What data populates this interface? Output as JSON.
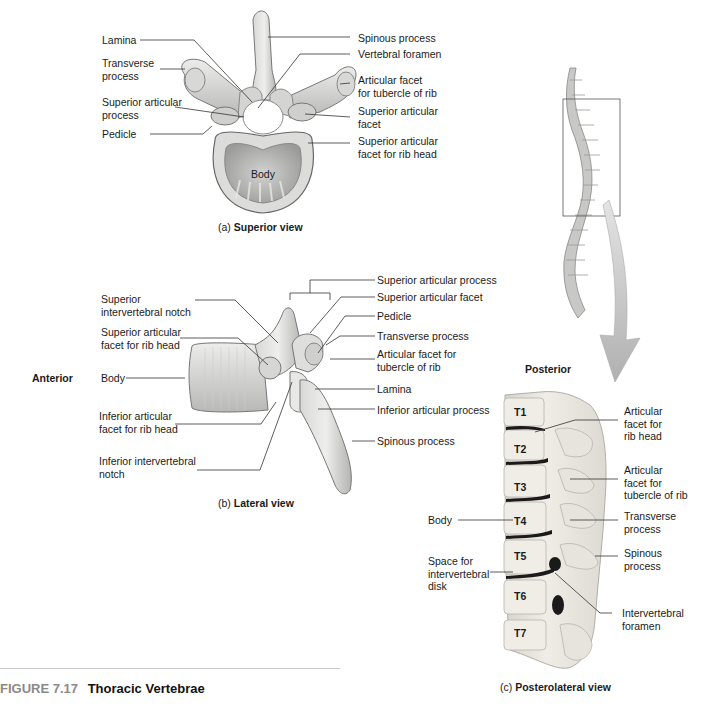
{
  "figure": {
    "number": "FIGURE 7.17",
    "title": "Thoracic Vertebrae"
  },
  "panel_a": {
    "caption_prefix": "(a)",
    "caption_bold": "Superior view",
    "body_label": "Body",
    "labels_left": [
      {
        "text": "Lamina"
      },
      {
        "text": "Transverse\nprocess"
      },
      {
        "text": "Superior articular\nprocess"
      },
      {
        "text": "Pedicle"
      }
    ],
    "labels_right": [
      {
        "text": "Spinous process"
      },
      {
        "text": "Vertebral foramen"
      },
      {
        "text": "Articular facet\nfor tubercle of rib"
      },
      {
        "text": "Superior articular\nfacet"
      },
      {
        "text": "Superior articular\nfacet for rib head"
      }
    ]
  },
  "panel_b": {
    "caption_prefix": "(b)",
    "caption_bold": "Lateral view",
    "orientation_left": "Anterior",
    "orientation_right": "Posterior",
    "labels_left": [
      {
        "text": "Superior\nintervertebral notch"
      },
      {
        "text": "Superior articular\nfacet for rib head"
      },
      {
        "text": "Body"
      },
      {
        "text": "Inferior articular\nfacet for rib head"
      },
      {
        "text": "Inferior intervertebral\nnotch"
      }
    ],
    "labels_right": [
      {
        "text": "Superior articular process"
      },
      {
        "text": "Superior articular facet"
      },
      {
        "text": "Pedicle"
      },
      {
        "text": "Transverse process"
      },
      {
        "text": "Articular facet for\ntubercle of rib"
      },
      {
        "text": "Lamina"
      },
      {
        "text": "Inferior articular process"
      },
      {
        "text": "Spinous process"
      }
    ]
  },
  "panel_c": {
    "caption_prefix": "(c)",
    "caption_bold": "Posterolateral view",
    "vertebra_labels": [
      "T1",
      "T2",
      "T3",
      "T4",
      "T5",
      "T6",
      "T7"
    ],
    "labels_left": [
      {
        "text": "Body"
      },
      {
        "text": "Space for\nintervertebral\ndisk"
      }
    ],
    "labels_right": [
      {
        "text": "Articular\nfacet for\nrib head"
      },
      {
        "text": "Articular\nfacet for\ntubercle of rib"
      },
      {
        "text": "Transverse\nprocess"
      },
      {
        "text": "Spinous\nprocess"
      },
      {
        "text": "Intervertebral\nforamen"
      }
    ]
  },
  "colors": {
    "bone_light": "#e6e6e4",
    "bone_mid": "#c4c4c2",
    "bone_dark": "#8e8e8c",
    "leader_line": "#333333",
    "arrow": "#bdbdbd",
    "figure_number": "#8a8a8a"
  }
}
